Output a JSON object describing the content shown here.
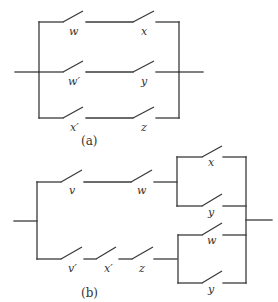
{
  "diagram": {
    "colors": {
      "wire": "#3a3a3a",
      "text": "#333333",
      "background": "#ffffff"
    },
    "part_a": {
      "caption": "(a)",
      "type": "parallel of three series branches",
      "branches": [
        {
          "switches": [
            "w",
            "x"
          ]
        },
        {
          "switches": [
            "w′",
            "y"
          ]
        },
        {
          "switches": [
            "x′",
            "z"
          ]
        }
      ]
    },
    "part_b": {
      "caption": "(b)",
      "type": "parallel of two series branches, each ending in a parallel pair",
      "branches": [
        {
          "series": [
            "v",
            "w"
          ],
          "parallel": [
            "x",
            "y"
          ]
        },
        {
          "series": [
            "v′",
            "x′",
            "z"
          ],
          "parallel": [
            "w",
            "y"
          ]
        }
      ]
    }
  }
}
